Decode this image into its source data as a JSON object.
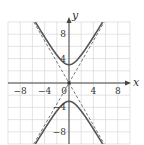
{
  "chart_data": {
    "type": "line",
    "title": "",
    "xlabel": "x",
    "ylabel": "y",
    "xlim": [
      -10,
      10
    ],
    "ylim": [
      -10,
      10
    ],
    "grid": true,
    "grid_step": 2,
    "x_ticks": [
      -8,
      -4,
      0,
      4,
      8
    ],
    "y_ticks": [
      8,
      4,
      -4,
      -8
    ],
    "x_tick_labels": [
      "−8",
      "−4",
      "0",
      "4",
      "8"
    ],
    "y_tick_labels": [
      "8",
      "4",
      "−4",
      "−8"
    ],
    "curve": {
      "name": "hyperbola",
      "equation": "y^2/9 - x^2/3 = 1",
      "vertices": [
        [
          0,
          3
        ],
        [
          0,
          -3
        ]
      ],
      "style": "solid",
      "color": "#555555"
    },
    "asymptotes": [
      {
        "name": "asymptote-positive",
        "slope": 1.732,
        "style": "dashed",
        "color": "#555555"
      },
      {
        "name": "asymptote-negative",
        "slope": -1.732,
        "style": "dashed",
        "color": "#555555"
      }
    ],
    "origin_marker": true
  },
  "colors": {
    "grid": "#d8d8d8",
    "axis": "#444444",
    "curve": "#555555",
    "asymptote": "#666666"
  },
  "labels": {
    "x_axis": "x",
    "y_axis": "y",
    "origin": "0"
  }
}
